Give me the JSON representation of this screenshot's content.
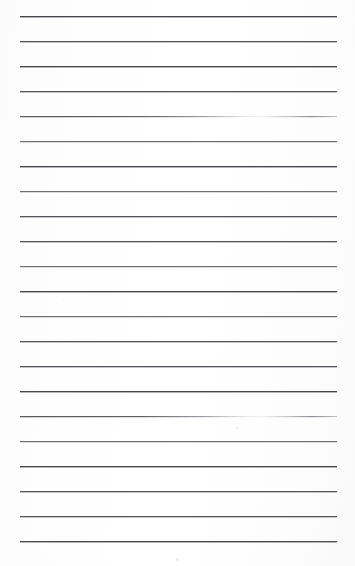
{
  "document": {
    "kind": "lined-paper-scan",
    "title": "Blank lined notebook page",
    "page_width": 355,
    "page_height": 566,
    "background_color": "#fdfdfd",
    "has_text_content": false,
    "body_text": "",
    "ruling": {
      "line_count": 22,
      "line_color": "#55565a",
      "line_thickness_px": 1,
      "line_spacing_px": 25,
      "first_line_y": 16,
      "last_line_y": 541,
      "left_margin_x": 20,
      "right_margin_x": 337,
      "line_length_px": 317,
      "bottom_blank_space_px": 25
    },
    "lines": [
      {
        "index": 1,
        "y": 16,
        "weight": "heavy",
        "faded": false
      },
      {
        "index": 2,
        "y": 41,
        "weight": "normal",
        "faded": false
      },
      {
        "index": 3,
        "y": 66,
        "weight": "heavy",
        "faded": false
      },
      {
        "index": 4,
        "y": 91,
        "weight": "normal",
        "faded": false
      },
      {
        "index": 5,
        "y": 116,
        "weight": "normal",
        "faded": true
      },
      {
        "index": 6,
        "y": 141,
        "weight": "light",
        "faded": false
      },
      {
        "index": 7,
        "y": 166,
        "weight": "heavy",
        "faded": false
      },
      {
        "index": 8,
        "y": 191,
        "weight": "light",
        "faded": false
      },
      {
        "index": 9,
        "y": 216,
        "weight": "normal",
        "faded": false
      },
      {
        "index": 10,
        "y": 241,
        "weight": "normal",
        "faded": false
      },
      {
        "index": 11,
        "y": 266,
        "weight": "light",
        "faded": false
      },
      {
        "index": 12,
        "y": 291,
        "weight": "heavy",
        "faded": false
      },
      {
        "index": 13,
        "y": 316,
        "weight": "light",
        "faded": false
      },
      {
        "index": 14,
        "y": 341,
        "weight": "normal",
        "faded": false
      },
      {
        "index": 15,
        "y": 366,
        "weight": "normal",
        "faded": false
      },
      {
        "index": 16,
        "y": 391,
        "weight": "heavy",
        "faded": false
      },
      {
        "index": 17,
        "y": 416,
        "weight": "normal",
        "faded": true
      },
      {
        "index": 18,
        "y": 441,
        "weight": "light",
        "faded": false
      },
      {
        "index": 19,
        "y": 466,
        "weight": "heavy",
        "faded": false
      },
      {
        "index": 20,
        "y": 491,
        "weight": "normal",
        "faded": false
      },
      {
        "index": 21,
        "y": 516,
        "weight": "normal",
        "faded": false
      },
      {
        "index": 22,
        "y": 541,
        "weight": "heavy",
        "faded": false
      }
    ],
    "artifacts": [
      {
        "name": "speck",
        "x": 236,
        "y": 427,
        "size": 2
      },
      {
        "name": "speck",
        "x": 176,
        "y": 558,
        "size": 3
      },
      {
        "name": "speck",
        "x": 63,
        "y": 300,
        "size": 1
      }
    ]
  }
}
